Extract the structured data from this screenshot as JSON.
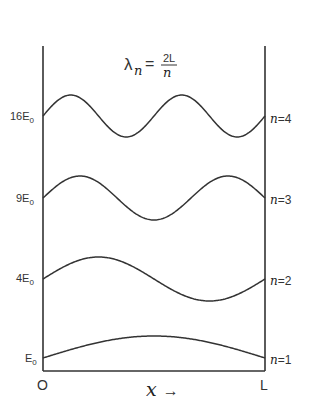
{
  "title_formula": {
    "lhs_symbol": "λ",
    "lhs_subscript": "n",
    "equals": "=",
    "numerator": "2L",
    "denominator": "n"
  },
  "energy_levels": [
    {
      "n": 4,
      "energy_label": "16E",
      "energy_sub": "0",
      "state_var": "n",
      "state_eq": "=4",
      "half_wavelengths": 4,
      "baseline_y": 116,
      "amplitude": 21
    },
    {
      "n": 3,
      "energy_label": "9E",
      "energy_sub": "0",
      "state_var": "n",
      "state_eq": "=3",
      "half_wavelengths": 3,
      "baseline_y": 198,
      "amplitude": 22
    },
    {
      "n": 2,
      "energy_label": "4E",
      "energy_sub": "0",
      "state_var": "n",
      "state_eq": "=2",
      "half_wavelengths": 2,
      "baseline_y": 279,
      "amplitude": 22
    },
    {
      "n": 1,
      "energy_label": "E",
      "energy_sub": "0",
      "state_var": "n",
      "state_eq": "=1",
      "half_wavelengths": 1,
      "baseline_y": 358,
      "amplitude": 22
    }
  ],
  "axis": {
    "origin_label": "O",
    "end_label": "L",
    "x_var": "x",
    "x_arrow": "→"
  },
  "box": {
    "left": 43,
    "right": 265,
    "top": 46,
    "bottom": 371
  },
  "colors": {
    "line": "#333333",
    "background": "#ffffff"
  }
}
